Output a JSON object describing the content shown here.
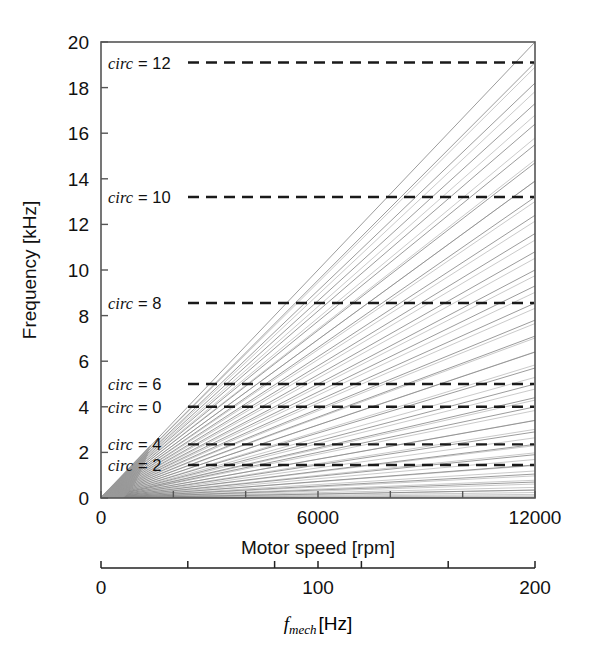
{
  "figure": {
    "background": "#ffffff",
    "frame_color": "#555555",
    "ray_color": "#8a8a8a",
    "dash_color": "#1a1a1a",
    "text_color": "#111111"
  },
  "chart_data": {
    "type": "line",
    "title": "",
    "xlabel": "Motor speed [rpm]",
    "ylabel": "Frequency [kHz]",
    "xlim": [
      0,
      12000
    ],
    "ylim": [
      0,
      20
    ],
    "grid": false,
    "legend_position": "inside-left",
    "xticks": [
      0,
      2000,
      4000,
      6000,
      8000,
      10000,
      12000
    ],
    "xticklabels": [
      "0",
      "",
      "",
      "6000",
      "",
      "",
      "12000"
    ],
    "yticks": [
      0,
      2,
      4,
      6,
      8,
      10,
      12,
      14,
      16,
      18,
      20
    ],
    "yticklabels": [
      "0",
      "2",
      "4",
      "6",
      "8",
      "10",
      "12",
      "14",
      "16",
      "18",
      "20"
    ],
    "secondary_axis": {
      "label_symbol": "f",
      "label_subscript": "mech",
      "label_unit": "[Hz]",
      "lim": [
        0,
        200
      ],
      "ticks": [
        0,
        40,
        80,
        100,
        120,
        160,
        200
      ],
      "ticklabels": [
        "0",
        "",
        "",
        "100",
        "",
        "",
        "200"
      ]
    },
    "rays": {
      "description": "fan of straight lines through the origin, value at x=12000 rpm in kHz",
      "values_at_xmax": [
        20.0,
        19.1,
        18.2,
        17.3,
        16.4,
        15.5,
        14.7,
        13.9,
        13.2,
        12.4,
        11.6,
        10.8,
        10.0,
        9.3,
        8.55,
        7.8,
        7.1,
        6.4,
        5.7,
        5.0,
        4.4,
        4.0,
        3.4,
        2.9,
        2.35,
        1.9,
        1.45,
        1.05,
        0.7,
        0.35
      ],
      "dense_wedge_count": 40
    },
    "dashed_lines": [
      {
        "label_word": "circ",
        "label_eq": "= 12",
        "value": 19.1
      },
      {
        "label_word": "circ",
        "label_eq": "= 10",
        "value": 13.2
      },
      {
        "label_word": "circ",
        "label_eq": "= 8",
        "value": 8.55
      },
      {
        "label_word": "circ",
        "label_eq": "= 6",
        "value": 5.0
      },
      {
        "label_word": "circ",
        "label_eq": "= 0",
        "value": 4.0
      },
      {
        "label_word": "circ",
        "label_eq": "= 4",
        "value": 2.35
      },
      {
        "label_word": "circ",
        "label_eq": "= 2",
        "value": 1.45
      }
    ]
  }
}
